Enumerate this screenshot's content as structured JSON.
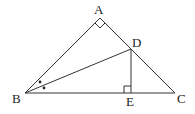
{
  "diagram": {
    "type": "geometry-triangle",
    "points": {
      "A": {
        "label": "A",
        "x": 100,
        "y": 18
      },
      "B": {
        "label": "B",
        "x": 25,
        "y": 93
      },
      "C": {
        "label": "C",
        "x": 175,
        "y": 93
      },
      "D": {
        "label": "D",
        "x": 131,
        "y": 49
      },
      "E": {
        "label": "E",
        "x": 131,
        "y": 93
      }
    },
    "segments": [
      "AB",
      "AC",
      "BC",
      "BD",
      "DE"
    ],
    "marks": {
      "right_angle_at_A": true,
      "right_angle_at_E": true,
      "equal_angles_at_B": "two dots (BD bisects angle ABC)"
    },
    "colors": {
      "stroke": "#333333",
      "background": "#ffffff"
    }
  }
}
